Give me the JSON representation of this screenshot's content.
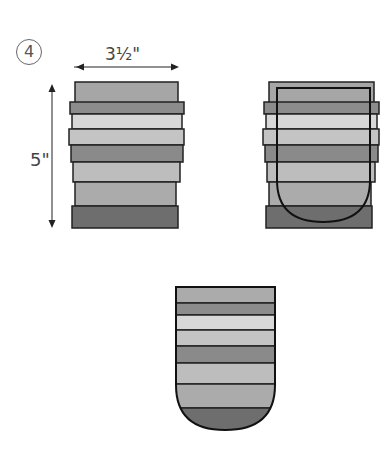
{
  "step": {
    "number": "4"
  },
  "dimensions": {
    "width_label": "3½\"",
    "height_label": "5\""
  },
  "colors": {
    "outline": "#222222",
    "strip_dark": "#6e6e6e",
    "strip_mid_dark": "#8a8a8a",
    "strip_mid": "#a8a8a8",
    "strip_light": "#c6c6c6",
    "strip_lightest": "#dcdcdc",
    "arrow": "#222222"
  },
  "figures": [
    {
      "id": "strip-set",
      "description": "Stacked fabric strips, 3½\" wide by 5\" tall"
    },
    {
      "id": "strip-set-with-template",
      "description": "Strip set with rounded U-shaped pocket template overlaid"
    },
    {
      "id": "cut-pocket",
      "description": "Pocket shape cut from strip set with rounded bottom"
    }
  ],
  "strips": [
    {
      "name": "strip-1",
      "shade": "strip_mid"
    },
    {
      "name": "strip-2",
      "shade": "strip_mid_dark"
    },
    {
      "name": "strip-3",
      "shade": "strip_lightest"
    },
    {
      "name": "strip-4",
      "shade": "strip_light"
    },
    {
      "name": "strip-5",
      "shade": "strip_mid_dark"
    },
    {
      "name": "strip-6",
      "shade": "strip_light"
    },
    {
      "name": "strip-7",
      "shade": "strip_mid"
    },
    {
      "name": "strip-8",
      "shade": "strip_dark"
    }
  ]
}
